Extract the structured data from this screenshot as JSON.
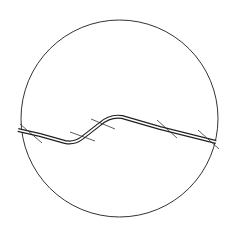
{
  "diagram": {
    "type": "section-detail",
    "background": "#ffffff",
    "stroke_color": "#333333",
    "boundary": {
      "shape": "circle",
      "cx": 119.5,
      "cy": 118.5,
      "r": 98.5
    },
    "bar": {
      "path": "M18,130 L40,135 L65,142 Q74,144 82,138 L100,124 Q110,115 122,117 L160,128 L216,142",
      "outer_width": 4,
      "inner_width": 1.6
    },
    "ticks": [
      {
        "x1": 20,
        "y1": 124,
        "x2": 42,
        "y2": 143
      },
      {
        "x1": 70,
        "y1": 132,
        "x2": 95,
        "y2": 141
      },
      {
        "x1": 91,
        "y1": 119,
        "x2": 115,
        "y2": 129
      },
      {
        "x1": 157,
        "y1": 120,
        "x2": 177,
        "y2": 138
      },
      {
        "x1": 198,
        "y1": 130,
        "x2": 219,
        "y2": 149
      }
    ]
  }
}
